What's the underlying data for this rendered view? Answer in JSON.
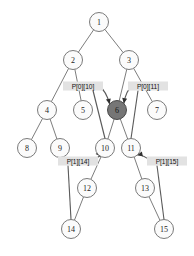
{
  "diagram": {
    "canvas": {
      "width": 194,
      "height": 256
    },
    "colors": {
      "background": "#ffffff",
      "node_fill": "#fbfbfb",
      "node_stroke": "#6b6b6b",
      "highlight_fill": "#767676",
      "edge": "#6e6e6e",
      "label_bg": "#e2e2e2",
      "label_text": "#111111",
      "arrow": "#303030"
    },
    "nodes": [
      {
        "id": "n1",
        "label": "1",
        "cx": 99,
        "cy": 22,
        "r": 9.5,
        "highlighted": false
      },
      {
        "id": "n2",
        "label": "2",
        "cx": 73,
        "cy": 60,
        "r": 9.5,
        "highlighted": false
      },
      {
        "id": "n3",
        "label": "3",
        "cx": 129,
        "cy": 60,
        "r": 9.5,
        "highlighted": false
      },
      {
        "id": "n4",
        "label": "4",
        "cx": 47,
        "cy": 110,
        "r": 9.5,
        "highlighted": false
      },
      {
        "id": "n5",
        "label": "5",
        "cx": 83,
        "cy": 110,
        "r": 9.5,
        "highlighted": false
      },
      {
        "id": "n6",
        "label": "6",
        "cx": 117,
        "cy": 110,
        "r": 9.5,
        "highlighted": true
      },
      {
        "id": "n7",
        "label": "7",
        "cx": 157,
        "cy": 110,
        "r": 9.5,
        "highlighted": false
      },
      {
        "id": "n8",
        "label": "8",
        "cx": 27,
        "cy": 148,
        "r": 9.5,
        "highlighted": false
      },
      {
        "id": "n9",
        "label": "9",
        "cx": 60,
        "cy": 148,
        "r": 9.5,
        "highlighted": false
      },
      {
        "id": "n10",
        "label": "10",
        "cx": 105,
        "cy": 148,
        "r": 9.5,
        "highlighted": false
      },
      {
        "id": "n11",
        "label": "11",
        "cx": 131,
        "cy": 148,
        "r": 9.5,
        "highlighted": false
      },
      {
        "id": "n12",
        "label": "12",
        "cx": 87,
        "cy": 188,
        "r": 9.5,
        "highlighted": false
      },
      {
        "id": "n13",
        "label": "13",
        "cx": 145,
        "cy": 188,
        "r": 9.5,
        "highlighted": false
      },
      {
        "id": "n14",
        "label": "14",
        "cx": 71,
        "cy": 229,
        "r": 9.5,
        "highlighted": false
      },
      {
        "id": "n15",
        "label": "15",
        "cx": 164,
        "cy": 229,
        "r": 9.5,
        "highlighted": false
      }
    ],
    "edges": [
      {
        "from": "n1",
        "to": "n2"
      },
      {
        "from": "n1",
        "to": "n3"
      },
      {
        "from": "n2",
        "to": "n4"
      },
      {
        "from": "n2",
        "to": "n5"
      },
      {
        "from": "n3",
        "to": "n6"
      },
      {
        "from": "n3",
        "to": "n7"
      },
      {
        "from": "n4",
        "to": "n8"
      },
      {
        "from": "n4",
        "to": "n9"
      },
      {
        "from": "n6",
        "to": "n10"
      },
      {
        "from": "n6",
        "to": "n11"
      },
      {
        "from": "n10",
        "to": "n12"
      },
      {
        "from": "n11",
        "to": "n13"
      },
      {
        "from": "n12",
        "to": "n14"
      },
      {
        "from": "n13",
        "to": "n15"
      }
    ],
    "pointer_labels": [
      {
        "id": "p0_10",
        "text": "P[0][10]",
        "x": 83,
        "y": 86,
        "w": 40,
        "h": 9,
        "target": "n6",
        "source": "n10"
      },
      {
        "id": "p0_11",
        "text": "P[0][11]",
        "x": 148,
        "y": 86,
        "w": 40,
        "h": 9,
        "target": "n6",
        "source": "n11"
      },
      {
        "id": "p1_14",
        "text": "P[1][14]",
        "x": 78,
        "y": 161,
        "w": 40,
        "h": 9,
        "target": "n10",
        "source": "n14"
      },
      {
        "id": "p1_15",
        "text": "P[1][15]",
        "x": 167,
        "y": 161,
        "w": 40,
        "h": 9,
        "target": "n11",
        "source": "n15"
      }
    ]
  }
}
